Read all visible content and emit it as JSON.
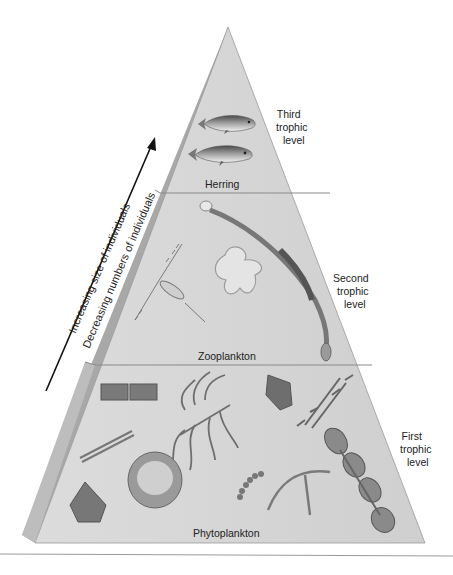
{
  "diagram": {
    "type": "trophic-pyramid",
    "levels": [
      {
        "name": "Herring",
        "level_label": [
          "Third",
          "trophic",
          "level"
        ]
      },
      {
        "name": "Zooplankton",
        "level_label": [
          "Second",
          "trophic",
          "level"
        ]
      },
      {
        "name": "Phytoplankton",
        "level_label": [
          "First",
          "trophic",
          "level"
        ]
      }
    ],
    "arrow": {
      "line1": "Increasing size of individuals",
      "line2": "Decreasing numbers of individuals"
    },
    "colors": {
      "front_face": "#d6d6d6",
      "side_face": "#a9a9a9",
      "divider": "#8a8a8a",
      "organism": "#6e6e6e"
    }
  }
}
